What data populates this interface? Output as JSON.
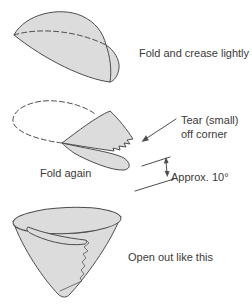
{
  "steps": {
    "step1_label": "Fold and crease lightly",
    "step2_label": "Fold again",
    "step3_label": "Open out like this"
  },
  "annotations": {
    "tear_callout_line1": "Tear (small)",
    "tear_callout_line2": "off corner",
    "angle_note": "Approx. 10°"
  },
  "colors": {
    "paper_fill": "#dcdcdc",
    "line": "#4d4d4d",
    "text": "#3a3a3a",
    "background": "#ffffff"
  }
}
